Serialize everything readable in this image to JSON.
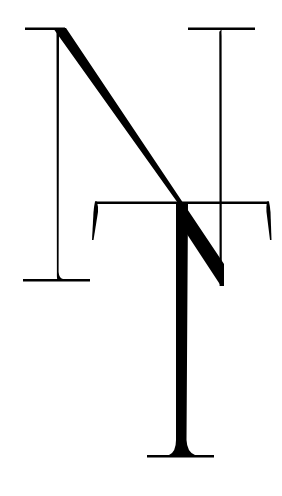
{
  "logo": {
    "monogram": "NT",
    "letters": [
      "N",
      "T"
    ],
    "ink_color": "#000000",
    "background_color": "#ffffff"
  }
}
